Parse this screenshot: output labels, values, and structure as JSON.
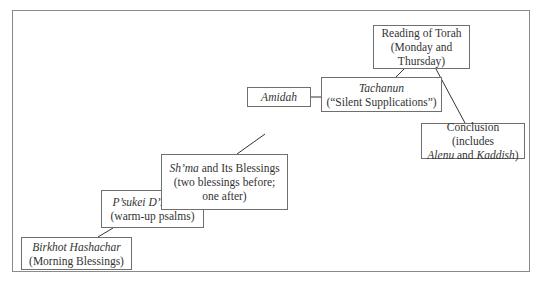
{
  "diagram": {
    "type": "flow-staircase",
    "nodes": [
      {
        "id": "birkhot",
        "lines": [
          {
            "italic": "Birkhot Hashachar"
          },
          {
            "text": "(Morning Blessings)"
          }
        ]
      },
      {
        "id": "psukei",
        "lines": [
          {
            "italic": "P’sukei D’zimrah"
          },
          {
            "text": "(warm-up psalms)"
          }
        ]
      },
      {
        "id": "shma",
        "lines": [
          {
            "italic": "Sh’ma",
            "text": " and Its Blessings"
          },
          {
            "text": "(two blessings before;"
          },
          {
            "text": "one after)"
          }
        ]
      },
      {
        "id": "amidah",
        "lines": [
          {
            "italic": "Amidah"
          }
        ]
      },
      {
        "id": "tachanun",
        "lines": [
          {
            "italic": "Tachanun"
          },
          {
            "text": "(“Silent Supplications”)"
          }
        ]
      },
      {
        "id": "torah",
        "lines": [
          {
            "text": "Reading of Torah"
          },
          {
            "text": "(Monday and"
          },
          {
            "text": "Thursday)"
          }
        ]
      },
      {
        "id": "conclusion",
        "lines": [
          {
            "text": "Conclusion (includes"
          },
          {
            "italic": "Alenu",
            "text": " and ",
            "italic2": "Kaddish",
            "text2": ")"
          }
        ]
      }
    ],
    "edges": [
      [
        "birkhot",
        "psukei"
      ],
      [
        "psukei",
        "shma"
      ],
      [
        "shma",
        "amidah"
      ],
      [
        "amidah",
        "tachanun"
      ],
      [
        "tachanun",
        "torah"
      ],
      [
        "torah",
        "conclusion"
      ]
    ],
    "colors": {
      "border": "#6f6f6f",
      "line": "#333333",
      "text": "#333333"
    }
  }
}
